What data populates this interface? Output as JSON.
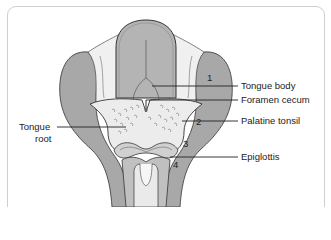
{
  "figure": {
    "structures": [
      {
        "id": "tongue-body",
        "label": "Tongue body"
      },
      {
        "id": "foramen-cecum",
        "label": "Foramen cecum"
      },
      {
        "id": "palatine-tonsil",
        "label": "Palatine tonsil"
      },
      {
        "id": "epiglottis",
        "label": "Epiglottis"
      },
      {
        "id": "tongue-root",
        "label_line1": "Tongue",
        "label_line2": "root"
      }
    ],
    "numbers": [
      "1",
      "2",
      "3",
      "4"
    ],
    "colors": {
      "fill_dark": "#a8a8a8",
      "fill_mid": "#c4c4c4",
      "fill_light": "#e6e6e6",
      "fill_pale": "#f2f2f2",
      "outline": "#333333",
      "frame": "#cfcfcf"
    }
  }
}
